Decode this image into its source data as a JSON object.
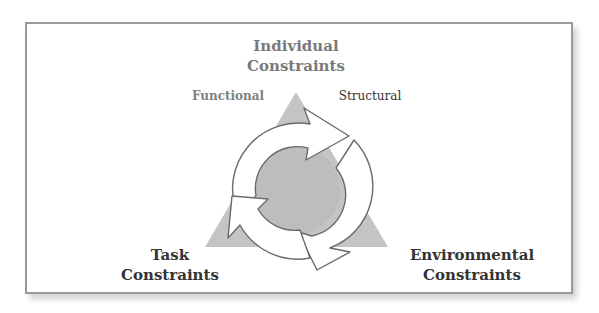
{
  "diagram": {
    "top": {
      "line1": "Individual",
      "line2": "Constraints"
    },
    "subtypes": {
      "left": "Functional",
      "right": "Structural"
    },
    "bottom_left": {
      "line1": "Task",
      "line2": "Constraints"
    },
    "bottom_right": {
      "line1": "Environmental",
      "line2": "Constraints"
    },
    "colors": {
      "triangle": "#c4c4c4",
      "center": "#bdbdbd",
      "arrow_fill": "#ffffff",
      "arrow_stroke": "#6a6a6a",
      "frame": "#9a9a9a"
    }
  }
}
